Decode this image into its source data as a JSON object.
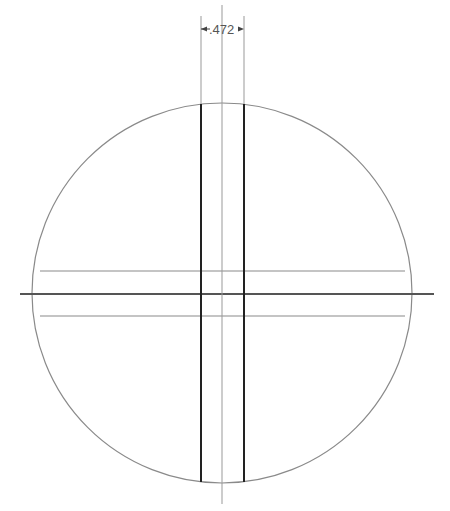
{
  "drawing": {
    "title": "Circular part with cross slots (top view)",
    "dimension": {
      "label": ".472",
      "type": "linear",
      "measures": "slot width"
    },
    "circle": {
      "cx": 222,
      "cy": 293,
      "r": 190
    },
    "colors": {
      "outline": "#888888",
      "slot_edge": "#222222",
      "centerline": "#666666",
      "text": "#555555"
    }
  }
}
